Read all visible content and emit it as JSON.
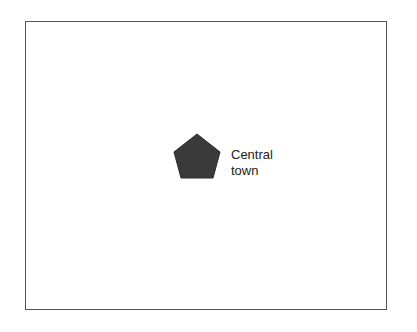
{
  "diagram": {
    "frame": {
      "border_color": "#555555"
    },
    "town": {
      "shape": "pentagon",
      "fill": "#3a3a3a",
      "label_line1": "Central",
      "label_line2": "town"
    }
  }
}
